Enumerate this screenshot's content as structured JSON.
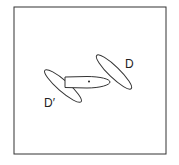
{
  "diagram": {
    "frame": {
      "x": 14,
      "y": 7,
      "width": 152,
      "height": 147
    },
    "stroke_color": "#333333",
    "ellipses": [
      {
        "name": "center-ellipse",
        "cx": 87,
        "cy": 82,
        "rx": 23,
        "ry": 6,
        "angle": 0
      },
      {
        "name": "ellipse-D",
        "cx": 114,
        "cy": 72,
        "rx": 24,
        "ry": 5.5,
        "angle": 44
      },
      {
        "name": "ellipse-D-prime",
        "cx": 63,
        "cy": 86,
        "rx": 24,
        "ry": 5.5,
        "angle": 41
      }
    ],
    "center_point": {
      "x": 89,
      "y": 81
    },
    "labels": {
      "D": "D",
      "D_prime": "D′"
    }
  }
}
